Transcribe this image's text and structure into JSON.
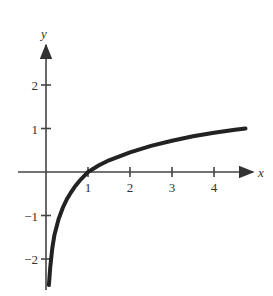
{
  "chart_data": {
    "type": "line",
    "title": "",
    "xlabel": "x",
    "ylabel": "y",
    "xlim": [
      0,
      4.8
    ],
    "ylim": [
      -2.6,
      2.7
    ],
    "x_ticks": [
      1,
      2,
      3,
      4
    ],
    "x_tick_labels": [
      "1",
      "2",
      "3",
      "4"
    ],
    "y_ticks": [
      -2,
      -1,
      1,
      2
    ],
    "y_tick_labels": [
      "−2",
      "−1",
      "1",
      "2"
    ],
    "grid": false,
    "legend": null,
    "series": [
      {
        "name": "curve",
        "x": [
          0.07,
          0.1,
          0.15,
          0.2,
          0.3,
          0.4,
          0.5,
          0.6,
          0.7,
          0.8,
          0.9,
          1.0,
          1.25,
          1.5,
          2.0,
          2.5,
          3.0,
          3.5,
          4.0,
          4.5,
          4.75
        ],
        "y": [
          -2.6,
          -2.2,
          -1.75,
          -1.45,
          -1.08,
          -0.82,
          -0.62,
          -0.46,
          -0.32,
          -0.2,
          -0.1,
          0.0,
          0.15,
          0.27,
          0.45,
          0.6,
          0.72,
          0.82,
          0.9,
          0.97,
          1.0
        ]
      }
    ]
  }
}
